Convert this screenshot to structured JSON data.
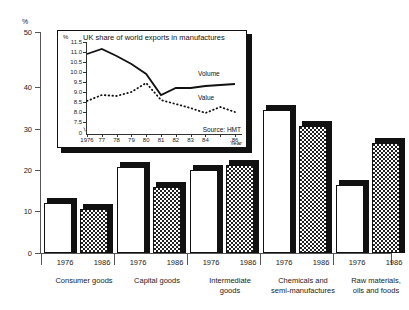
{
  "main": {
    "y_unit_label": "%",
    "y_ticks": [
      "0",
      "10",
      "20",
      "30",
      "40",
      "50"
    ],
    "categories": [
      {
        "label_line1": "Consumer goods",
        "label_line2": "",
        "years": [
          "1976",
          "1986"
        ]
      },
      {
        "label_line1": "Capital goods",
        "label_line2": "",
        "years": [
          "1976",
          "1986"
        ]
      },
      {
        "label_line1": "Intermediate",
        "label_line2": "goods",
        "years": [
          "1976",
          "1986"
        ]
      },
      {
        "label_line1": "Chemicals and",
        "label_line2": "semi-manufactures",
        "years": [
          "1976",
          "1986"
        ]
      },
      {
        "label_line1": "Raw materials,",
        "label_line2": "oils and foods",
        "years": [
          "1976",
          "1986"
        ]
      }
    ]
  },
  "inset": {
    "title": "UK share of world exports in manufactures",
    "y_unit_label": "%",
    "y_ticks": [
      "11.5",
      "11.0",
      "10.5",
      "10.0",
      "9.5",
      "9.0",
      "8.5",
      "8.0",
      "7.5"
    ],
    "y_zero_label": "0",
    "x_ticks": [
      "1976",
      "77",
      "78",
      "79",
      "80",
      "81",
      "82",
      "83",
      "84",
      "",
      "86"
    ],
    "x_axis_label": "Year",
    "series_labels": {
      "volume": "Volume",
      "value": "Value"
    },
    "source": "Source: HMT"
  },
  "chart_data": [
    {
      "type": "bar",
      "title": "",
      "xlabel": "",
      "ylabel": "%",
      "ylim": [
        0,
        50
      ],
      "grid": false,
      "legend_position": "none",
      "categories": [
        "Consumer goods",
        "Capital goods",
        "Intermediate goods",
        "Chemicals and semi-manufactures",
        "Raw materials, oils and foods"
      ],
      "series": [
        {
          "name": "1976",
          "values": [
            11.3,
            19.5,
            18.8,
            32.3,
            15.4
          ]
        },
        {
          "name": "1986",
          "values": [
            10.0,
            15.0,
            20.0,
            28.7,
            25.0
          ]
        }
      ]
    },
    {
      "type": "line",
      "title": "UK share of world exports in manufactures",
      "xlabel": "Year",
      "ylabel": "%",
      "ylim": [
        7.5,
        11.5
      ],
      "grid": false,
      "legend_position": "inline-right",
      "annotations": [
        "Source: HMT"
      ],
      "x": [
        1976,
        1977,
        1978,
        1979,
        1980,
        1981,
        1982,
        1983,
        1984,
        1985,
        1986
      ],
      "series": [
        {
          "name": "Volume",
          "values": [
            10.9,
            11.15,
            10.8,
            10.4,
            9.9,
            8.85,
            9.2,
            9.2,
            9.3,
            9.35,
            9.4
          ]
        },
        {
          "name": "Value",
          "values": [
            8.55,
            8.85,
            8.8,
            9.0,
            9.45,
            8.6,
            8.4,
            8.2,
            7.95,
            8.25,
            8.0
          ]
        }
      ]
    }
  ]
}
